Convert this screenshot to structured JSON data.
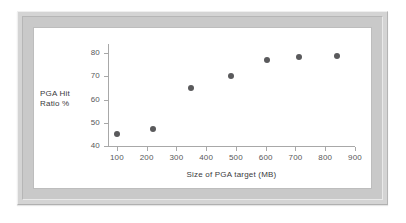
{
  "figure": {
    "frame_color": "#c9c9c9",
    "canvas_color": "#ffffff",
    "axis_color": "#a8a8a8",
    "marker_color": "#5a5a5c"
  },
  "chart_data": {
    "type": "scatter",
    "title": "",
    "xlabel": "Size of PGA target (MB)",
    "ylabel": "PGA Hit Ratio %",
    "ylabel_lines": [
      "PGA Hit",
      "Ratio %"
    ],
    "x": [
      100,
      222,
      348,
      483,
      605,
      713,
      838
    ],
    "values": [
      45,
      47.5,
      65,
      70,
      77,
      78.3,
      78.8
    ],
    "xlim": [
      70,
      900
    ],
    "ylim": [
      40,
      84
    ],
    "xticks": [
      100,
      200,
      300,
      400,
      500,
      600,
      700,
      800,
      900
    ],
    "xticklabels": [
      "100",
      "200",
      "300",
      "400",
      "500",
      "600",
      "700",
      "800",
      "900"
    ],
    "yticks": [
      40,
      50,
      60,
      70,
      80
    ],
    "yticklabels": [
      "40",
      "50",
      "60",
      "70",
      "80"
    ],
    "grid": false,
    "legend": null,
    "marker": "circle",
    "points": [
      {
        "x": 100,
        "y": 45
      },
      {
        "x": 222,
        "y": 47.5
      },
      {
        "x": 348,
        "y": 65
      },
      {
        "x": 483,
        "y": 70
      },
      {
        "x": 605,
        "y": 77
      },
      {
        "x": 713,
        "y": 78.3
      },
      {
        "x": 838,
        "y": 78.8
      }
    ]
  }
}
